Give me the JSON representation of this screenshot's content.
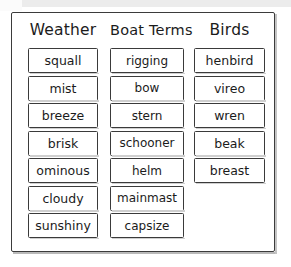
{
  "worksheet": {
    "type": "word-sort",
    "columns": [
      {
        "header": "Weather",
        "words": [
          "squall",
          "mist",
          "breeze",
          "brisk",
          "ominous",
          "cloudy",
          "sunshiny"
        ]
      },
      {
        "header": "Boat Terms",
        "words": [
          "rigging",
          "bow",
          "stern",
          "schooner",
          "helm",
          "mainmast",
          "capsize"
        ]
      },
      {
        "header": "Birds",
        "words": [
          "henbird",
          "vireo",
          "wren",
          "beak",
          "breast"
        ]
      }
    ]
  },
  "colors": {
    "ink": "#1b1b1b",
    "border": "#3a3a3a",
    "frame": "#3b3b3b",
    "paper": "#ffffff",
    "scan_edge": "#ececec"
  }
}
